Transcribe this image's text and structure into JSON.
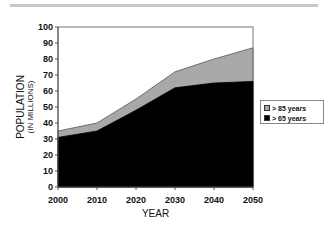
{
  "chart_data": {
    "type": "area",
    "stacked": false,
    "title": "",
    "xlabel": "YEAR",
    "ylabel": "POPULATION",
    "ylabel_sub": "(IN MILLIONS)",
    "x": [
      2000,
      2010,
      2020,
      2030,
      2040,
      2050
    ],
    "xticks": [
      "2000",
      "2010",
      "2020",
      "2030",
      "2040",
      "2050"
    ],
    "yticks": [
      "0",
      "10",
      "20",
      "30",
      "40",
      "50",
      "60",
      "70",
      "80",
      "90",
      "100"
    ],
    "ylim": [
      0,
      100
    ],
    "grid": false,
    "legend_position": "right",
    "series": [
      {
        "name": "> 85 years",
        "color": "#a8a8a8",
        "values": [
          35,
          40,
          55,
          72,
          80,
          87
        ]
      },
      {
        "name": "> 65 years",
        "color": "#000000",
        "values": [
          31,
          35,
          48,
          62,
          65,
          66
        ]
      }
    ]
  },
  "legend": {
    "items": [
      {
        "label": "> 85 years",
        "color": "#a8a8a8"
      },
      {
        "label": "> 65 years",
        "color": "#000000"
      }
    ]
  }
}
